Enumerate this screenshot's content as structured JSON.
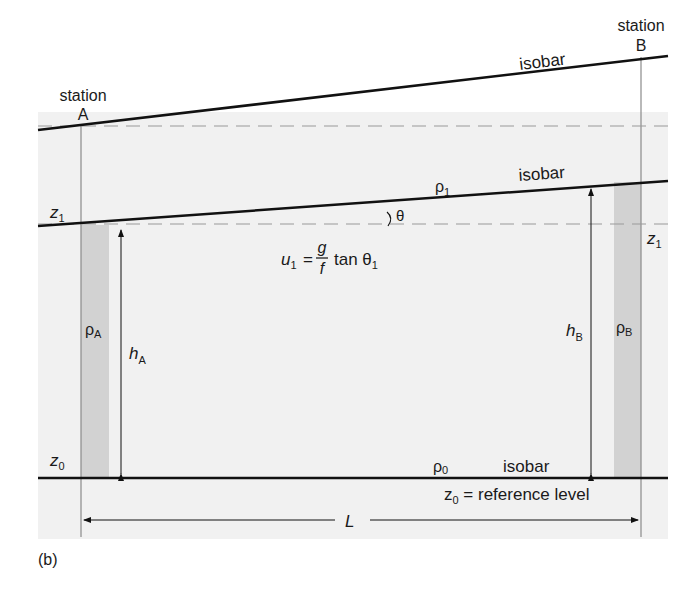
{
  "figure": {
    "panel_label": "(b)",
    "stations": {
      "a": {
        "word": "station",
        "letter": "A"
      },
      "b": {
        "word": "station",
        "letter": "B"
      }
    },
    "isobars": {
      "top": "isobar",
      "middle": "isobar",
      "bottom": "isobar"
    },
    "densities": {
      "rho_1": "ρ",
      "rho_1_sub": "1",
      "rho_0": "ρ",
      "rho_0_sub": "0",
      "rho_a": "ρ",
      "rho_a_sub": "A",
      "rho_b": "ρ",
      "rho_b_sub": "B"
    },
    "heights": {
      "z1_left": "z",
      "z1_left_sub": "1",
      "z1_right": "z",
      "z1_right_sub": "1",
      "z0_left": "z",
      "z0_left_sub": "0",
      "h_a": "h",
      "h_a_sub": "A",
      "h_b": "h",
      "h_b_sub": "B"
    },
    "angle": "θ",
    "equation": {
      "lhs": "u",
      "lhs_sub": "1",
      "equals": "=",
      "numerator": "g",
      "denominator": "f",
      "func": "tan θ",
      "func_sub": "1"
    },
    "reference": {
      "z": "z",
      "z_sub": "0",
      "text": " = reference level"
    },
    "distance": "L",
    "colors": {
      "panel": "#f1f1f1",
      "column": "#d2d2d2",
      "line": "#111111",
      "dashed": "#9a9a9a",
      "station_line": "#8a8a8a"
    }
  }
}
